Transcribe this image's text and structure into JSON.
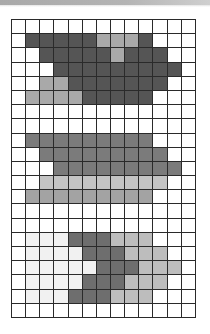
{
  "board": {
    "columns": 13,
    "rows": 21,
    "palette": {
      "w": "#ffffff",
      "v": "#f1f1f1",
      "D": "#555555",
      "L": "#a9a9a9",
      "M": "#7b7b7b",
      "P": "#c4c4c4",
      "Q": "#a3a3a3",
      "K": "#6e6e6e",
      "G": "#bdbdbd"
    },
    "cells": [
      "wwwwwwwwwwwww",
      "wDDDDDLLLDwww",
      "wwDDDDDLDDDww",
      "wwwDDDDDDDDDw",
      "wwLLDDDDDDDww",
      "wLLLLDDDDDwww",
      "wwwwwwwwwwwww",
      "wwwwwwwwwwwww",
      "wMMMMMMMMMwww",
      "wwMMMMMMMMMww",
      "wwwMMMMMMMMMw",
      "wwPPPPPPPPPww",
      "wQQQQQQQQQwww",
      "wwwwwwwwwwwww",
      "wwwwwwwwwwwww",
      "wvvvKKKGGGwww",
      "wvvvvKKKGGGww",
      "wvvvvvKKKGGGw",
      "wvvvvKKKGGGww",
      "wvvvKKKGGGwww",
      "wwwwwwwwwwwww"
    ]
  }
}
